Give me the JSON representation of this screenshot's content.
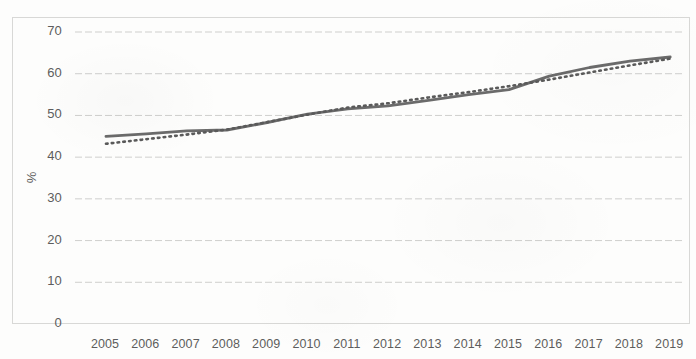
{
  "chart_data": {
    "type": "line",
    "title": "",
    "subtitle": "",
    "xlabel": "",
    "ylabel": "%",
    "categories": [
      "2005",
      "2006",
      "2007",
      "2008",
      "2009",
      "2010",
      "2011",
      "2012",
      "2013",
      "2014",
      "2015",
      "2016",
      "2017",
      "2018",
      "2019"
    ],
    "ylim": [
      0,
      70
    ],
    "ytick_labels": [
      "70",
      "60",
      "50",
      "40",
      "30",
      "20",
      "10",
      "0"
    ],
    "ytick_values": [
      70,
      60,
      50,
      40,
      30,
      20,
      10,
      0
    ],
    "grid": true,
    "grid_axis": "y",
    "legend": "none",
    "legend_position": "none",
    "annotations": [],
    "series": [
      {
        "name": "solid-line",
        "style": "solid",
        "color": "#6b6b6b",
        "values": [
          45.0,
          45.6,
          46.3,
          46.5,
          48.3,
          50.3,
          51.6,
          52.3,
          53.6,
          55.0,
          56.2,
          59.4,
          61.5,
          63.0,
          64.0
        ]
      },
      {
        "name": "dotted-line",
        "style": "dotted",
        "color": "#5a5a5a",
        "values": [
          43.2,
          44.3,
          45.4,
          46.6,
          48.4,
          50.2,
          51.9,
          52.9,
          54.3,
          55.6,
          57.0,
          58.6,
          60.3,
          62.0,
          63.6
        ]
      }
    ]
  },
  "axis": {
    "y_title": "%"
  }
}
